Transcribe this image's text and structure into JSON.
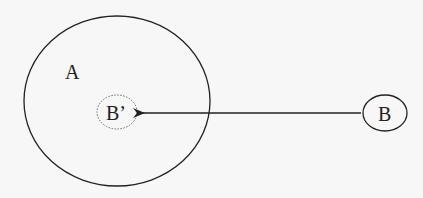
{
  "diagram": {
    "nodes": {
      "outer": {
        "label": "A"
      },
      "projected": {
        "label": "B’"
      },
      "source": {
        "label": "B"
      }
    },
    "edges": [
      {
        "from": "B",
        "to": "B’",
        "style": "arrow"
      }
    ],
    "colors": {
      "stroke": "#222222",
      "background": "#f7f7f7",
      "dotted": "#666666"
    }
  }
}
